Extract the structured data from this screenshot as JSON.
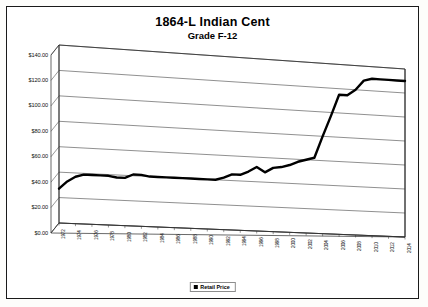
{
  "chart_data": {
    "type": "line",
    "title": "1864-L Indian Cent",
    "subtitle": "Grade F-12",
    "xlabel": "",
    "ylabel": "",
    "ylim": [
      0,
      140
    ],
    "ytick_step": 20,
    "grid": true,
    "legend_position": "bottom",
    "style": "3d-perspective",
    "ytick_labels": [
      "$0.00",
      "$20.00",
      "$40.00",
      "$60.00",
      "$80.00",
      "$100.00",
      "$120.00",
      "$140.00"
    ],
    "ytick_values": [
      0,
      20,
      40,
      60,
      80,
      100,
      120,
      140
    ],
    "xtick_labels": [
      "1972",
      "1974",
      "1976",
      "1978",
      "1980",
      "1982",
      "1984",
      "1986",
      "1988",
      "1990",
      "1992",
      "1994",
      "1996",
      "1998",
      "2000",
      "2002",
      "2004",
      "2006",
      "2008",
      "2010",
      "2012",
      "2014"
    ],
    "series": [
      {
        "name": "Retail Price",
        "color": "#000000",
        "x": [
          1972,
          1973,
          1974,
          1975,
          1976,
          1977,
          1978,
          1979,
          1980,
          1981,
          1982,
          1983,
          1984,
          1985,
          1986,
          1987,
          1988,
          1989,
          1990,
          1991,
          1992,
          1993,
          1994,
          1995,
          1996,
          1997,
          1998,
          1999,
          2000,
          2001,
          2002,
          2003,
          2004,
          2005,
          2006,
          2007,
          2008,
          2009,
          2010,
          2011,
          2012,
          2013,
          2014
        ],
        "values": [
          27,
          33,
          37,
          39,
          39,
          39,
          39,
          38,
          38,
          41,
          41,
          40,
          40,
          40,
          40,
          40,
          40,
          40,
          40,
          40,
          42,
          45,
          45,
          48,
          52,
          48,
          52,
          53,
          55,
          58,
          60,
          62,
          80,
          97,
          115,
          115,
          120,
          128,
          130,
          130,
          130,
          130,
          130
        ]
      }
    ]
  },
  "legend": {
    "items": [
      {
        "label": "Retail Price",
        "color": "#000000"
      }
    ]
  }
}
